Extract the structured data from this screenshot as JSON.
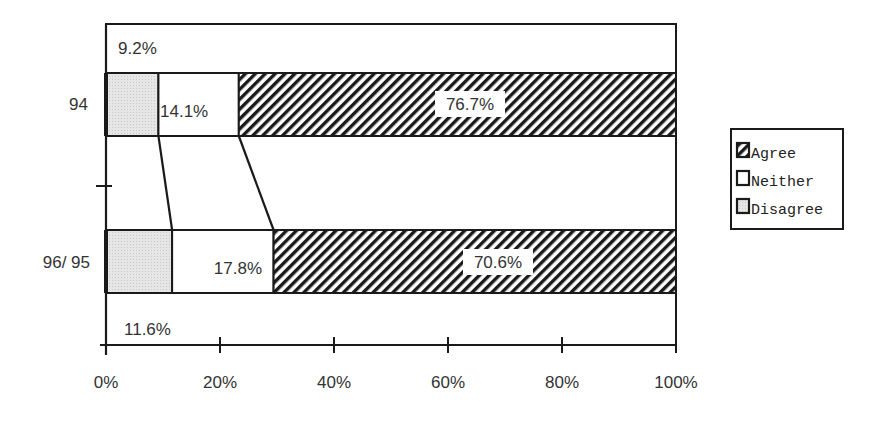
{
  "chart_data": {
    "type": "bar",
    "orientation": "horizontal",
    "stacked": true,
    "percent_stacked": true,
    "title": "",
    "xlabel": "",
    "ylabel": "",
    "xlim": [
      0,
      100
    ],
    "x_ticks": [
      "0%",
      "20%",
      "40%",
      "60%",
      "80%",
      "100%"
    ],
    "categories": [
      "94",
      "96/ 95"
    ],
    "series": [
      {
        "name": "Disagree",
        "values": [
          9.2,
          11.6
        ],
        "labels": [
          "9.2%",
          "11.6%"
        ],
        "fill": "dotted-gray"
      },
      {
        "name": "Neither",
        "values": [
          14.1,
          17.8
        ],
        "labels": [
          "14.1%",
          "17.8%"
        ],
        "fill": "white"
      },
      {
        "name": "Agree",
        "values": [
          76.7,
          70.6
        ],
        "labels": [
          "76.7%",
          "70.6%"
        ],
        "fill": "diagonal-hatch"
      }
    ],
    "legend": {
      "position": "right",
      "entries": [
        "Agree",
        "Neither",
        "Disagree"
      ]
    },
    "series_lines": true,
    "grid": false
  },
  "colors": {
    "ink": "#1a1a1a",
    "disagree_fill": "#e4e4e4",
    "neither_fill": "#ffffff",
    "background": "#ffffff"
  }
}
